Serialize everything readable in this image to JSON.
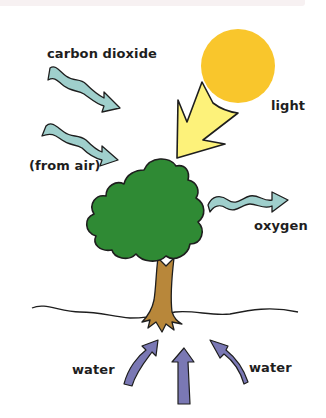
{
  "diagram": {
    "labels": {
      "carbon_dioxide": "carbon dioxide",
      "from_air": "(from air)",
      "light": "light",
      "oxygen": "oxygen",
      "water_left": "water",
      "water_right": "water"
    },
    "icons": {
      "sun": "sun-icon",
      "light_arrow": "light-arrow-icon",
      "co2_arrows": "wavy-arrow-icon",
      "oxygen_arrow": "wavy-arrow-icon",
      "water_arrows": "arrow-up-icon",
      "tree": "tree-icon"
    },
    "colors": {
      "sun": "#f9c62c",
      "light_arrow": "#fdf27a",
      "air_arrow": "#9fcfcc",
      "foliage": "#2f8a34",
      "trunk": "#b8873a",
      "water_arrow": "#7a78b4",
      "outline": "#1e1e1e",
      "text": "#1e1e1e"
    }
  }
}
